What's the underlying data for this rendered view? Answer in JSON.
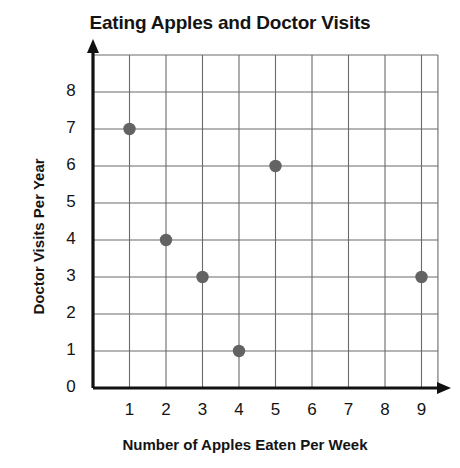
{
  "chart_data": {
    "type": "scatter",
    "title": "Eating Apples and Doctor Visits",
    "xlabel": "Number of Apples Eaten Per Week",
    "ylabel": "Doctor Visits Per Year",
    "xlim": [
      0,
      9.5
    ],
    "ylim": [
      0,
      8.5
    ],
    "grid": true,
    "legend": "none",
    "x_ticks": [
      "1",
      "2",
      "3",
      "4",
      "5",
      "6",
      "7",
      "8",
      "9"
    ],
    "y_ticks": [
      "0",
      "1",
      "2",
      "3",
      "4",
      "5",
      "6",
      "7",
      "8"
    ],
    "point_color": "#636363",
    "axis_color": "#111111",
    "grid_color": "#6a6a6a",
    "points": [
      {
        "x": 1,
        "y": 7
      },
      {
        "x": 2,
        "y": 4
      },
      {
        "x": 3,
        "y": 3
      },
      {
        "x": 4,
        "y": 1
      },
      {
        "x": 5,
        "y": 6
      },
      {
        "x": 9,
        "y": 3
      }
    ]
  }
}
